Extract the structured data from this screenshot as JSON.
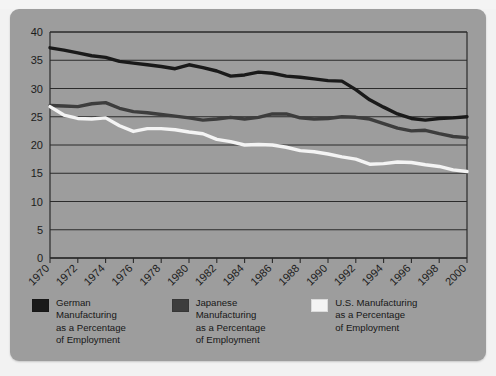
{
  "figure": {
    "background_color": "#f2f2f2",
    "panel_color": "#9d9d9d",
    "top_partial_text": ""
  },
  "legend": {
    "position": "below-axis",
    "items": [
      {
        "name": "german",
        "label": "German\nManufacturing\nas a Percentage\nof Employment",
        "color": "#1a1a1a",
        "swatch_icon": "legend-swatch-german"
      },
      {
        "name": "japanese",
        "label": "Japanese\nManufacturing\nas a Percentage\nof Employment",
        "color": "#3d3d3d",
        "swatch_icon": "legend-swatch-japanese"
      },
      {
        "name": "us",
        "label": "U.S. Manufacturing\nas a Percentage\nof Employment",
        "color": "#f4f4f4",
        "swatch_icon": "legend-swatch-us"
      }
    ]
  },
  "chart_data": {
    "type": "line",
    "title": "",
    "subtitle": "",
    "xlabel": "",
    "ylabel": "",
    "xlim": [
      1970,
      2000
    ],
    "ylim": [
      0,
      40
    ],
    "yticks": [
      0,
      5,
      10,
      15,
      20,
      25,
      30,
      35,
      40
    ],
    "ytick_labels": [
      "0",
      "5",
      "10",
      "15",
      "20",
      "25",
      "30",
      "35",
      "40"
    ],
    "xticks": [
      1970,
      1971,
      1972,
      1973,
      1974,
      1975,
      1976,
      1977,
      1978,
      1979,
      1980,
      1981,
      1982,
      1983,
      1984,
      1985,
      1986,
      1987,
      1988,
      1989,
      1990,
      1991,
      1992,
      1993,
      1994,
      1995,
      1996,
      1997,
      1998,
      1999,
      2000
    ],
    "xtick_labels": [
      "1970",
      "1972",
      "1974",
      "1976",
      "1978",
      "1980",
      "1982",
      "1984",
      "1986",
      "1988",
      "1990",
      "1992",
      "1994",
      "1996",
      "1998",
      "2000"
    ],
    "xtick_label_values": [
      1970,
      1972,
      1974,
      1976,
      1978,
      1980,
      1982,
      1984,
      1986,
      1988,
      1990,
      1992,
      1994,
      1996,
      1998,
      2000
    ],
    "xtick_label_rotation": -45,
    "grid": "horizontal",
    "grid_color": "#2b2b2b",
    "x": [
      1970,
      1971,
      1972,
      1973,
      1974,
      1975,
      1976,
      1977,
      1978,
      1979,
      1980,
      1981,
      1982,
      1983,
      1984,
      1985,
      1986,
      1987,
      1988,
      1989,
      1990,
      1991,
      1992,
      1993,
      1994,
      1995,
      1996,
      1997,
      1998,
      1999,
      2000
    ],
    "series": [
      {
        "name": "German Manufacturing as a Percentage of Employment",
        "short_name": "German",
        "color": "#1a1a1a",
        "line_width": 3.4,
        "values": [
          37.2,
          36.8,
          36.3,
          35.8,
          35.5,
          34.8,
          34.5,
          34.2,
          33.9,
          33.5,
          34.2,
          33.7,
          33.1,
          32.2,
          32.4,
          32.9,
          32.7,
          32.2,
          32.0,
          31.7,
          31.4,
          31.3,
          29.8,
          28.0,
          26.7,
          25.5,
          24.7,
          24.4,
          24.7,
          24.8,
          25.0
        ]
      },
      {
        "name": "Japanese Manufacturing as a Percentage of Employment",
        "short_name": "Japanese",
        "color": "#3d3d3d",
        "line_width": 3.4,
        "values": [
          27.0,
          26.9,
          26.8,
          27.3,
          27.5,
          26.5,
          25.9,
          25.7,
          25.4,
          25.1,
          24.8,
          24.4,
          24.6,
          24.9,
          24.6,
          24.9,
          25.5,
          25.5,
          24.8,
          24.6,
          24.7,
          25.0,
          24.9,
          24.6,
          23.8,
          23.0,
          22.5,
          22.6,
          22.0,
          21.5,
          21.3
        ]
      },
      {
        "name": "U.S. Manufacturing as a Percentage of Employment",
        "short_name": "U.S. Manufacturing",
        "color": "#f4f4f4",
        "line_width": 3.4,
        "values": [
          26.8,
          25.3,
          24.7,
          24.6,
          24.8,
          23.4,
          22.4,
          22.9,
          22.9,
          22.7,
          22.3,
          22.0,
          21.0,
          20.6,
          20.0,
          20.1,
          20.0,
          19.6,
          19.0,
          18.8,
          18.4,
          17.9,
          17.5,
          16.6,
          16.7,
          17.0,
          16.9,
          16.5,
          16.2,
          15.6,
          15.3
        ]
      }
    ]
  }
}
